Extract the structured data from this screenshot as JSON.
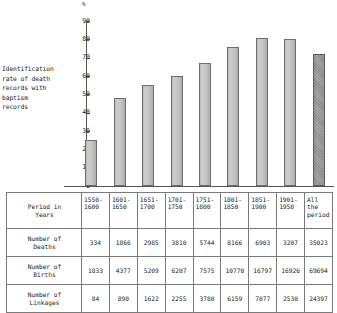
{
  "chart_data": {
    "type": "bar",
    "title": "",
    "unit_symbol": "%",
    "ylabel": "Identification rate of death records with baptism records",
    "xlabel": "",
    "ylim": [
      0,
      90
    ],
    "yticks": [
      0,
      10,
      20,
      30,
      40,
      50,
      60,
      70,
      80,
      90
    ],
    "grid": false,
    "legend": "none",
    "categories": [
      "1550-1600",
      "1601-1650",
      "1651-1700",
      "1701-1750",
      "1751-1800",
      "1801-1850",
      "1851-1900",
      "1901-1950",
      "All the period"
    ],
    "values": [
      25,
      48,
      55,
      60,
      67,
      76,
      81,
      80,
      72
    ],
    "highlight_last": true
  },
  "chart": {
    "unit": "%",
    "axis_label_lines": [
      "Identification",
      "rate of death",
      "records with",
      "baptism",
      "records"
    ],
    "y_ticks": [
      "90",
      "80",
      "70",
      "60",
      "50",
      "40",
      "30",
      "20",
      "10",
      "0"
    ]
  },
  "table": {
    "rows": [
      {
        "label": "Period in\nYears",
        "name": "row-period-in-years",
        "type": "header",
        "cells": [
          "1550-\n1600",
          "1601-\n1650",
          "1651-\n1700",
          "1701-\n1750",
          "1751-\n1800",
          "1801-\n1850",
          "1851-\n1900",
          "1901-\n1950",
          "All\nthe\nperiod"
        ]
      },
      {
        "label": "Number of\nDeaths",
        "name": "row-number-of-deaths",
        "type": "data",
        "cells": [
          "334",
          "1866",
          "2985",
          "3810",
          "5744",
          "8166",
          "6903",
          "3207",
          "35023"
        ]
      },
      {
        "label": "Number of\nBirths",
        "name": "row-number-of-births",
        "type": "data",
        "cells": [
          "1833",
          "4377",
          "5209",
          "6207",
          "7575",
          "10770",
          "16797",
          "16926",
          "69694"
        ]
      },
      {
        "label": "Number of\nLinkages",
        "name": "row-number-of-linkages",
        "type": "data",
        "cells": [
          "84",
          "890",
          "1622",
          "2255",
          "3780",
          "6159",
          "7077",
          "2530",
          "24397"
        ]
      }
    ]
  },
  "colors": {
    "bar_fill": "#c6c6c6",
    "bar_border": "#6e6e6e",
    "bar_last_fill": "#9e9e9e",
    "axis": "#555555",
    "table_border": "#7a7a7a",
    "text": "#1a1a1a",
    "background": "#ffffff"
  }
}
